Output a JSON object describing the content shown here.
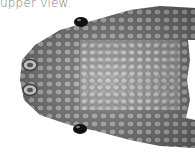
{
  "figure": {
    "caption": "upper view.",
    "colors": {
      "background": "#ffffff",
      "scale_dark": "#5a5a5a",
      "scale_mid": "#8a8a8a",
      "scale_light": "#c8c8c8",
      "eye": "#111111",
      "caption": "#7a7a7a"
    }
  }
}
